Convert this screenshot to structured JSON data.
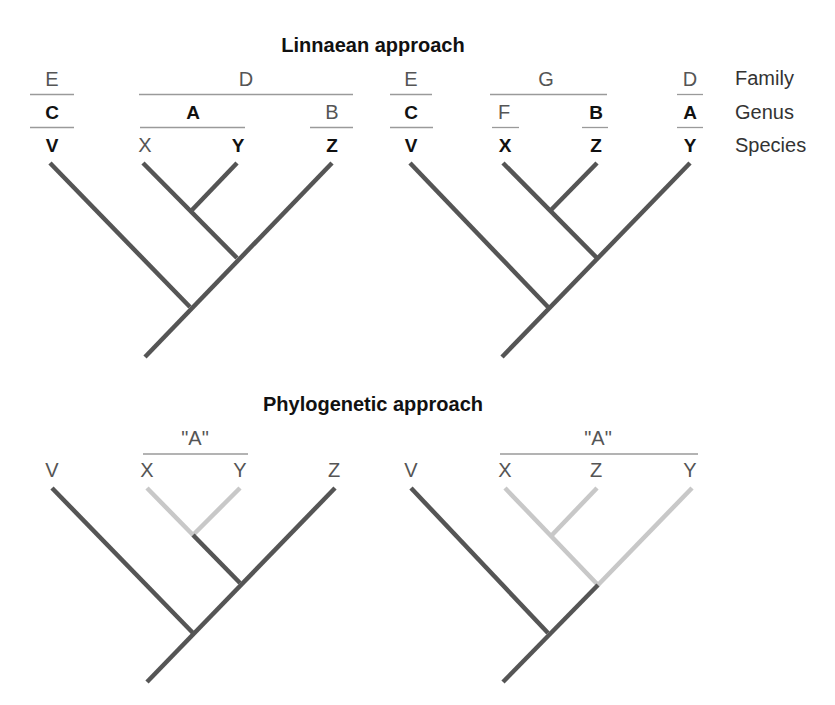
{
  "colors": {
    "branch_dark": "#555555",
    "branch_light": "#c8c8c8",
    "rule": "#9a9a9a",
    "text_dark": "#111111",
    "text_light": "#555555"
  },
  "linnaean": {
    "title": "Linnaean approach",
    "row_labels": {
      "family": "Family",
      "genus": "Genus",
      "species": "Species"
    },
    "tree1": {
      "family": [
        {
          "label": "E",
          "x": 52,
          "x1": 30,
          "x2": 74
        },
        {
          "label": "D",
          "x": 246,
          "x1": 139,
          "x2": 353
        }
      ],
      "genus": [
        {
          "label": "C",
          "x": 52,
          "x1": 30,
          "x2": 74,
          "bold": true
        },
        {
          "label": "A",
          "x": 193,
          "x1": 140,
          "x2": 245,
          "bold": true
        },
        {
          "label": "B",
          "x": 332,
          "x1": 310,
          "x2": 353,
          "bold": false
        }
      ],
      "species": [
        {
          "label": "V",
          "x": 52,
          "bold": true
        },
        {
          "label": "X",
          "x": 145,
          "bold": false
        },
        {
          "label": "Y",
          "x": 238,
          "bold": true
        },
        {
          "label": "Z",
          "x": 332,
          "bold": true
        }
      ]
    },
    "tree2": {
      "family": [
        {
          "label": "E",
          "x": 411,
          "x1": 390,
          "x2": 432
        },
        {
          "label": "G",
          "x": 546,
          "x1": 490,
          "x2": 607
        },
        {
          "label": "D",
          "x": 690,
          "x1": 677,
          "x2": 703
        }
      ],
      "genus": [
        {
          "label": "C",
          "x": 411,
          "x1": 390,
          "x2": 433,
          "bold": true
        },
        {
          "label": "F",
          "x": 504,
          "x1": 492,
          "x2": 519,
          "bold": false
        },
        {
          "label": "B",
          "x": 596,
          "x1": 582,
          "x2": 608,
          "bold": true
        },
        {
          "label": "A",
          "x": 690,
          "x1": 677,
          "x2": 703,
          "bold": true
        }
      ],
      "species": [
        {
          "label": "V",
          "x": 411,
          "bold": true
        },
        {
          "label": "X",
          "x": 505,
          "bold": true
        },
        {
          "label": "Z",
          "x": 596,
          "bold": true
        },
        {
          "label": "Y",
          "x": 690,
          "bold": true
        }
      ]
    }
  },
  "phylogenetic": {
    "title": "Phylogenetic approach",
    "tree3": {
      "group": {
        "label": "\"A\"",
        "x": 195,
        "x1": 143,
        "x2": 248
      },
      "species": [
        {
          "label": "V",
          "x": 52
        },
        {
          "label": "X",
          "x": 147
        },
        {
          "label": "Y",
          "x": 240
        },
        {
          "label": "Z",
          "x": 334
        }
      ]
    },
    "tree4": {
      "group": {
        "label": "\"A\"",
        "x": 598,
        "x1": 500,
        "x2": 698
      },
      "species": [
        {
          "label": "V",
          "x": 411
        },
        {
          "label": "X",
          "x": 505
        },
        {
          "label": "Z",
          "x": 596
        },
        {
          "label": "Y",
          "x": 690
        }
      ]
    }
  },
  "trees": [
    {
      "name": "tree-linnaean-1",
      "branches": [
        {
          "from": [
            50,
            163
          ],
          "to": [
            190,
            307
          ],
          "c": "dark"
        },
        {
          "from": [
            143,
            163
          ],
          "to": [
            237,
            258
          ],
          "c": "dark"
        },
        {
          "from": [
            237,
            163
          ],
          "to": [
            192,
            210
          ],
          "c": "dark"
        },
        {
          "from": [
            332,
            163
          ],
          "to": [
            145,
            357
          ],
          "c": "dark"
        }
      ]
    },
    {
      "name": "tree-linnaean-2",
      "branches": [
        {
          "from": [
            410,
            163
          ],
          "to": [
            548,
            307
          ],
          "c": "dark"
        },
        {
          "from": [
            503,
            163
          ],
          "to": [
            597,
            258
          ],
          "c": "dark"
        },
        {
          "from": [
            597,
            163
          ],
          "to": [
            551,
            210
          ],
          "c": "dark"
        },
        {
          "from": [
            690,
            163
          ],
          "to": [
            502,
            357
          ],
          "c": "dark"
        }
      ]
    },
    {
      "name": "tree-phylogenetic-1",
      "branches": [
        {
          "from": [
            52,
            488
          ],
          "to": [
            193,
            633
          ],
          "c": "dark"
        },
        {
          "from": [
            147,
            488
          ],
          "to": [
            193,
            535
          ],
          "c": "light"
        },
        {
          "from": [
            240,
            488
          ],
          "to": [
            193,
            535
          ],
          "c": "light"
        },
        {
          "from": [
            193,
            535
          ],
          "to": [
            240,
            583
          ],
          "c": "dark"
        },
        {
          "from": [
            335,
            488
          ],
          "to": [
            147,
            682
          ],
          "c": "dark"
        }
      ]
    },
    {
      "name": "tree-phylogenetic-2",
      "branches": [
        {
          "from": [
            411,
            488
          ],
          "to": [
            548,
            633
          ],
          "c": "dark"
        },
        {
          "from": [
            505,
            488
          ],
          "to": [
            598,
            585
          ],
          "c": "light"
        },
        {
          "from": [
            597,
            488
          ],
          "to": [
            552,
            535
          ],
          "c": "light"
        },
        {
          "from": [
            692,
            488
          ],
          "to": [
            598,
            585
          ],
          "c": "light"
        },
        {
          "from": [
            598,
            585
          ],
          "to": [
            503,
            682
          ],
          "c": "dark"
        }
      ]
    }
  ]
}
